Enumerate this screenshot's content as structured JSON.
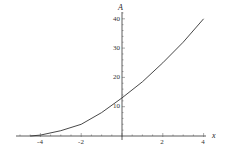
{
  "chart_data": {
    "type": "line",
    "title": "",
    "xlabel": "x",
    "ylabel": "A",
    "xlim": [
      -5.2,
      4.5
    ],
    "ylim": [
      0,
      42
    ],
    "x_ticks": [
      -4,
      -2,
      2,
      4
    ],
    "y_ticks": [
      10,
      20,
      30,
      40
    ],
    "grid": false,
    "legend": null,
    "series": [
      {
        "name": "A(x)",
        "x": [
          -4.5,
          -4,
          -3,
          -2,
          -1,
          0,
          1,
          2,
          3,
          4
        ],
        "values": [
          0,
          0.3,
          1.8,
          4,
          8,
          13,
          18.5,
          25,
          32,
          40
        ]
      }
    ]
  },
  "labels": {
    "x_axis": "x",
    "y_axis": "A",
    "x_tick_labels": [
      "-4",
      "-2",
      "2",
      "4"
    ],
    "y_tick_labels": [
      "10",
      "20",
      "30",
      "40"
    ]
  }
}
